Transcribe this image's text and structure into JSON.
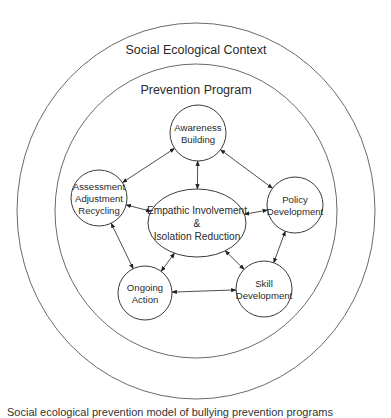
{
  "diagram": {
    "outer_ring": {
      "label": "Social Ecological Context",
      "cx": 196,
      "cy": 211,
      "rx": 179,
      "ry": 188,
      "label_x": 196,
      "label_y": 54
    },
    "inner_ring": {
      "label": "Prevention Program",
      "cx": 196,
      "cy": 211,
      "rx": 141,
      "ry": 147,
      "label_x": 196,
      "label_y": 94
    },
    "nodes": [
      {
        "id": "awareness",
        "lines": [
          "Awareness",
          "Building"
        ],
        "cx": 198,
        "cy": 133,
        "rx": 28,
        "ry": 28
      },
      {
        "id": "assessment",
        "lines": [
          "Assessment",
          "Adjustment",
          "Recycling"
        ],
        "cx": 99,
        "cy": 198,
        "rx": 28,
        "ry": 28
      },
      {
        "id": "policy",
        "lines": [
          "Policy",
          "Development"
        ],
        "cx": 295,
        "cy": 205,
        "rx": 28,
        "ry": 28
      },
      {
        "id": "empathic",
        "lines": [
          "Empathic Involvement",
          "&",
          "Isolation Reduction"
        ],
        "cx": 197,
        "cy": 223,
        "rx": 49,
        "ry": 34
      },
      {
        "id": "ongoing",
        "lines": [
          "Ongoing",
          "Action"
        ],
        "cx": 145,
        "cy": 293,
        "rx": 27,
        "ry": 27
      },
      {
        "id": "skill",
        "lines": [
          "Skill",
          "Development"
        ],
        "cx": 264,
        "cy": 289,
        "rx": 28,
        "ry": 28
      }
    ],
    "links": [
      {
        "from": "awareness",
        "to": "assessment",
        "bidirectional": true
      },
      {
        "from": "awareness",
        "to": "policy",
        "bidirectional": true
      },
      {
        "from": "awareness",
        "to": "empathic",
        "bidirectional": true
      },
      {
        "from": "assessment",
        "to": "empathic",
        "bidirectional": true
      },
      {
        "from": "assessment",
        "to": "ongoing",
        "bidirectional": true
      },
      {
        "from": "policy",
        "to": "empathic",
        "bidirectional": true
      },
      {
        "from": "policy",
        "to": "skill",
        "bidirectional": true
      },
      {
        "from": "empathic",
        "to": "ongoing",
        "bidirectional": true
      },
      {
        "from": "empathic",
        "to": "skill",
        "bidirectional": true
      },
      {
        "from": "ongoing",
        "to": "skill",
        "bidirectional": true
      }
    ]
  },
  "caption": "Social ecological prevention model of bullying prevention programs"
}
